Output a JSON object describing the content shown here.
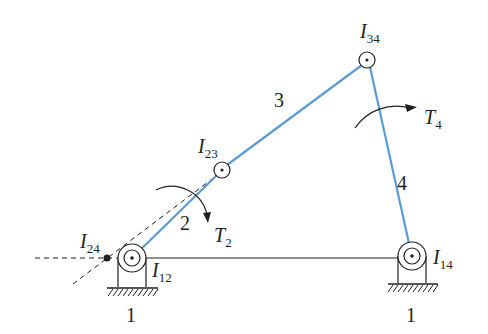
{
  "diagram": {
    "colors": {
      "link": "#5b9bd5",
      "ink": "#231f20",
      "background": "#ffffff"
    },
    "links": [
      {
        "id": "1",
        "label": "1",
        "role": "ground"
      },
      {
        "id": "2",
        "label": "2",
        "role": "crank"
      },
      {
        "id": "3",
        "label": "3",
        "role": "coupler"
      },
      {
        "id": "4",
        "label": "4",
        "role": "rocker"
      }
    ],
    "ground_labels": [
      "1",
      "1"
    ],
    "instant_centers": [
      {
        "name": "I",
        "sub": "12"
      },
      {
        "name": "I",
        "sub": "23"
      },
      {
        "name": "I",
        "sub": "34"
      },
      {
        "name": "I",
        "sub": "14"
      },
      {
        "name": "I",
        "sub": "24"
      }
    ],
    "torques": [
      {
        "name": "T",
        "sub": "2"
      },
      {
        "name": "T",
        "sub": "4"
      }
    ]
  }
}
